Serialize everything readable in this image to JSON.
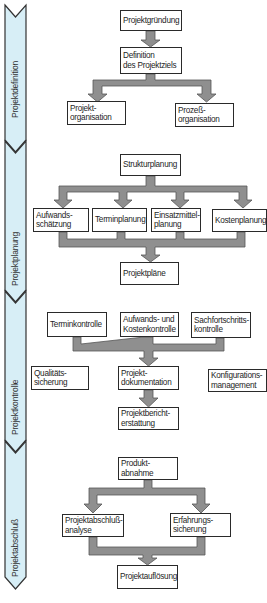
{
  "diagram": {
    "type": "phase-flowchart",
    "colors": {
      "phase_band_fill": "#d7eef6",
      "phase_band_stroke": "#333333",
      "arrow_fill": "#8f8f8f",
      "arrow_stroke": "#555555",
      "box_border": "#2a2a2a"
    },
    "phases": [
      {
        "id": "projektdefinition",
        "label": "Projektdefinition"
      },
      {
        "id": "projektplanung",
        "label": "Projektplanung"
      },
      {
        "id": "projektkontrolle",
        "label": "Projektkontrolle"
      },
      {
        "id": "projektabschluss",
        "label": "Projektabschluß"
      }
    ],
    "nodes": {
      "projektgruendung": {
        "lines": [
          "Projektgründung"
        ]
      },
      "definition": {
        "lines": [
          "Definition",
          "des Projektziels"
        ]
      },
      "projektorganisation": {
        "lines": [
          "Projekt-",
          "organisation"
        ]
      },
      "prozessorganisation": {
        "lines": [
          "Prozeß-",
          "organisation"
        ]
      },
      "strukturplanung": {
        "lines": [
          "Strukturplanung"
        ]
      },
      "aufwandsschaetzung": {
        "lines": [
          "Aufwands-",
          "schätzung"
        ]
      },
      "terminplanung": {
        "lines": [
          "Terminplanung"
        ]
      },
      "einsatzmittelplanung": {
        "lines": [
          "Einsatzmittel-",
          "planung"
        ]
      },
      "kostenplanung": {
        "lines": [
          "Kostenplanung"
        ]
      },
      "projektplaene": {
        "lines": [
          "Projektpläne"
        ]
      },
      "terminkontrolle": {
        "lines": [
          "Terminkontrolle"
        ]
      },
      "aufwandskosten": {
        "lines": [
          "Aufwands- und",
          "Kostenkontrolle"
        ]
      },
      "sachfortschritt": {
        "lines": [
          "Sachfortschritts-",
          "kontrolle"
        ]
      },
      "qualitaet": {
        "lines": [
          "Qualitäts-",
          "sicherung"
        ]
      },
      "dokumentation": {
        "lines": [
          "Projekt-",
          "dokumentation"
        ]
      },
      "konfiguration": {
        "lines": [
          "Konfigurations-",
          "management"
        ]
      },
      "berichterstattung": {
        "lines": [
          "Projektbericht-",
          "erstattung"
        ]
      },
      "produktabnahme": {
        "lines": [
          "Produkt-",
          "abnahme"
        ]
      },
      "abschlussanalyse": {
        "lines": [
          "Projektabschluß-",
          "analyse"
        ]
      },
      "erfahrung": {
        "lines": [
          "Erfahrungs-",
          "sicherung"
        ]
      },
      "aufloesung": {
        "lines": [
          "Projektauflösung"
        ]
      }
    },
    "edges": [
      [
        "projektgruendung",
        "definition"
      ],
      [
        "definition",
        "projektorganisation"
      ],
      [
        "definition",
        "prozessorganisation"
      ],
      [
        "strukturplanung",
        "aufwandsschaetzung"
      ],
      [
        "strukturplanung",
        "terminplanung"
      ],
      [
        "strukturplanung",
        "einsatzmittelplanung"
      ],
      [
        "strukturplanung",
        "kostenplanung"
      ],
      [
        "aufwandsschaetzung",
        "projektplaene"
      ],
      [
        "terminplanung",
        "projektplaene"
      ],
      [
        "einsatzmittelplanung",
        "projektplaene"
      ],
      [
        "kostenplanung",
        "projektplaene"
      ],
      [
        "terminkontrolle",
        "dokumentation"
      ],
      [
        "aufwandskosten",
        "dokumentation"
      ],
      [
        "sachfortschritt",
        "dokumentation"
      ],
      [
        "dokumentation",
        "berichterstattung"
      ],
      [
        "produktabnahme",
        "abschlussanalyse"
      ],
      [
        "produktabnahme",
        "erfahrung"
      ],
      [
        "abschlussanalyse",
        "aufloesung"
      ],
      [
        "erfahrung",
        "aufloesung"
      ]
    ]
  }
}
